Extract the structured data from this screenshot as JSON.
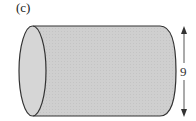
{
  "figure": {
    "label": "(c)",
    "shape": "cylinder",
    "dimension": {
      "value": "9",
      "orientation": "vertical"
    },
    "colors": {
      "fill": "#cfcfcf",
      "stroke": "#333333",
      "background": "#ffffff"
    }
  }
}
